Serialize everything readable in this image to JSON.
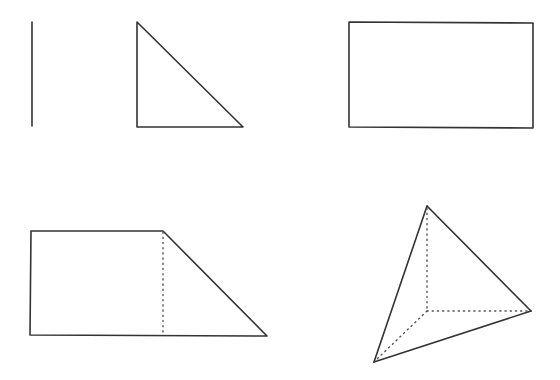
{
  "diagram": {
    "width": 560,
    "height": 380,
    "background": "#ffffff",
    "stroke_color": "#333333",
    "hidden_edge_color": "#555555",
    "shapes": [
      {
        "name": "line-segment",
        "kind": "line",
        "points": [
          [
            32,
            22
          ],
          [
            32,
            126
          ]
        ]
      },
      {
        "name": "right-triangle",
        "kind": "polygon",
        "points": [
          [
            137,
            22
          ],
          [
            137,
            127
          ],
          [
            243,
            127
          ]
        ]
      },
      {
        "name": "rectangle",
        "kind": "polygon",
        "points": [
          [
            349,
            22
          ],
          [
            533,
            23
          ],
          [
            533,
            128
          ],
          [
            349,
            127
          ]
        ]
      },
      {
        "name": "trapezoid",
        "kind": "polygon",
        "points": [
          [
            31,
            231
          ],
          [
            163,
            231
          ],
          [
            267,
            336
          ],
          [
            30,
            335
          ]
        ],
        "hidden_edges": [
          [
            [
              163,
              232
            ],
            [
              163,
              334
            ]
          ]
        ]
      },
      {
        "name": "tetrahedron",
        "kind": "polyhedron",
        "visible_edges": [
          [
            [
              427,
              206
            ],
            [
              374,
              362
            ]
          ],
          [
            [
              427,
              206
            ],
            [
              531,
              311
            ]
          ],
          [
            [
              374,
              362
            ],
            [
              531,
              311
            ]
          ]
        ],
        "hidden_edges": [
          [
            [
              427,
              208
            ],
            [
              427,
              311
            ]
          ],
          [
            [
              427,
              311
            ],
            [
              529,
              311
            ]
          ],
          [
            [
              427,
              311
            ],
            [
              376,
              360
            ]
          ]
        ]
      }
    ]
  }
}
